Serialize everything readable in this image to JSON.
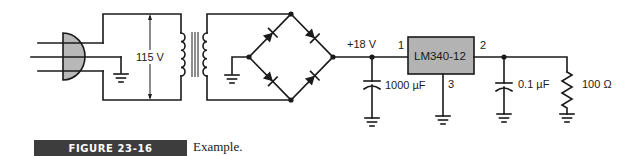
{
  "figure": {
    "number_label": "FIGURE 23-16",
    "caption": "Example.",
    "caption_bar_color": "#3d3d3d"
  },
  "circuit": {
    "plug": {
      "fill_color": "#b8b8b8"
    },
    "source_voltage_label": "115 V",
    "rectifier_output_label": "+18 V",
    "regulator": {
      "part_label": "LM340-12",
      "pin_in": "1",
      "pin_out": "2",
      "pin_gnd": "3",
      "fill_color": "#b3b3b3"
    },
    "input_capacitor_label": "1000 µF",
    "output_capacitor_label": "0.1 µF",
    "load_resistor_label": "100 Ω"
  }
}
